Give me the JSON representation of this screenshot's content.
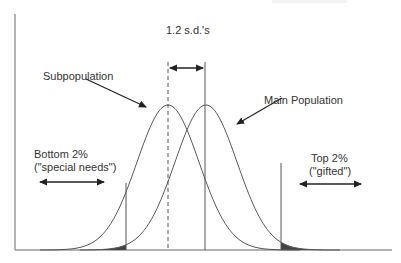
{
  "labels": {
    "sd_gap": "1.2 s.d.'s",
    "subpopulation": "Subpopulation",
    "main_population": "Main Population",
    "bottom_line1": "Bottom 2%",
    "bottom_line2": "(\"special needs\")",
    "top_line1": "Top 2%",
    "top_line2": "(\"gifted\")"
  },
  "geometry": {
    "sub_mean_x": 168,
    "main_mean_x": 206,
    "peak_y": 105,
    "baseline_y": 250,
    "sigma_px": 31,
    "left_cutoff_x": 126,
    "right_cutoff_x": 281
  },
  "colors": {
    "line": "#555555",
    "shade": "#444444",
    "text": "#333333"
  }
}
